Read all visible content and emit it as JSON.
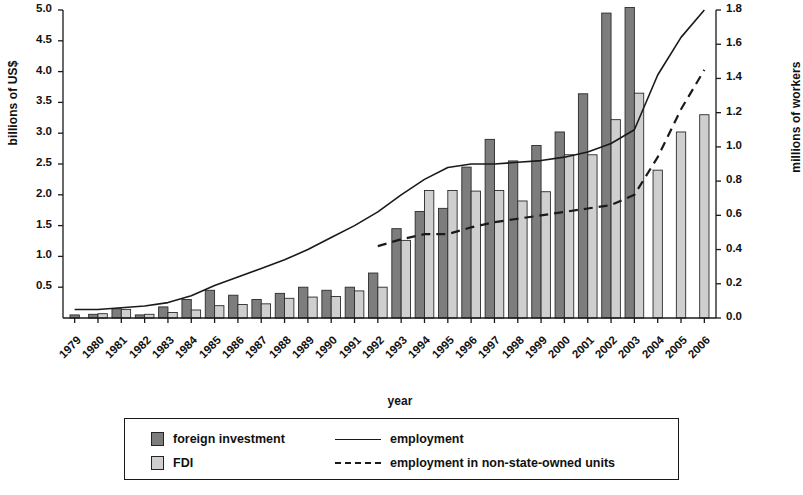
{
  "chart_data": {
    "type": "bar",
    "title": "",
    "xlabel": "year",
    "ylabel": "billions of US$",
    "ylabel_right": "millions of workers",
    "grid": false,
    "legend_position": "bottom",
    "ylim": [
      0,
      5.0
    ],
    "ylim_right": [
      0,
      1.8
    ],
    "yticks": [
      "0.0",
      "0.5",
      "1.0",
      "1.5",
      "2.0",
      "2.5",
      "3.0",
      "3.5",
      "4.0",
      "4.5",
      "5.0"
    ],
    "yticks_right": [
      "0.0",
      "0.2",
      "0.4",
      "0.6",
      "0.8",
      "1.0",
      "1.2",
      "1.4",
      "1.6",
      "1.8"
    ],
    "categories": [
      "1979",
      "1980",
      "1981",
      "1982",
      "1983",
      "1984",
      "1985",
      "1986",
      "1987",
      "1988",
      "1989",
      "1990",
      "1991",
      "1992",
      "1993",
      "1994",
      "1995",
      "1996",
      "1997",
      "1998",
      "1999",
      "2000",
      "2001",
      "2002",
      "2003",
      "2004",
      "2005",
      "2006"
    ],
    "series": [
      {
        "name": "foreign investment",
        "kind": "bar",
        "axis": "left",
        "color": "#7d7d7d",
        "values": [
          0.05,
          0.06,
          0.15,
          0.05,
          0.18,
          0.3,
          0.45,
          0.37,
          0.3,
          0.4,
          0.5,
          0.45,
          0.5,
          0.73,
          1.45,
          1.73,
          1.78,
          2.45,
          2.9,
          2.55,
          2.8,
          3.02,
          3.64,
          4.95,
          5.04,
          null,
          null,
          null
        ]
      },
      {
        "name": "FDI",
        "kind": "bar",
        "axis": "left",
        "color": "#cfcfcf",
        "values": [
          null,
          0.07,
          0.14,
          0.06,
          0.09,
          0.13,
          0.2,
          0.22,
          0.23,
          0.32,
          0.34,
          0.35,
          0.44,
          0.5,
          1.26,
          2.07,
          2.07,
          2.06,
          2.07,
          1.9,
          2.05,
          2.65,
          2.65,
          3.22,
          3.65,
          2.4,
          3.02,
          3.3
        ]
      },
      {
        "name": "employment",
        "kind": "line",
        "axis": "right",
        "style": "solid",
        "values": [
          0.05,
          0.05,
          0.06,
          0.07,
          0.09,
          0.13,
          0.19,
          0.24,
          0.29,
          0.34,
          0.4,
          0.47,
          0.54,
          0.62,
          0.72,
          0.81,
          0.88,
          0.9,
          0.9,
          0.91,
          0.92,
          0.94,
          0.97,
          1.02,
          1.1,
          1.42,
          1.64,
          1.8
        ]
      },
      {
        "name": "employment in non-state-owned units",
        "kind": "line",
        "axis": "right",
        "style": "dashed",
        "values": [
          null,
          null,
          null,
          null,
          null,
          null,
          null,
          null,
          null,
          null,
          null,
          null,
          null,
          0.42,
          0.46,
          0.49,
          0.49,
          0.53,
          0.56,
          0.58,
          0.6,
          0.62,
          0.64,
          0.66,
          0.72,
          0.94,
          1.22,
          1.45
        ]
      }
    ],
    "legend": [
      {
        "label": "foreign investment",
        "marker": "dark-square"
      },
      {
        "label": "FDI",
        "marker": "light-square"
      },
      {
        "label": "employment",
        "marker": "solid-line"
      },
      {
        "label": "employment in non-state-owned units",
        "marker": "dashed-line"
      }
    ]
  }
}
